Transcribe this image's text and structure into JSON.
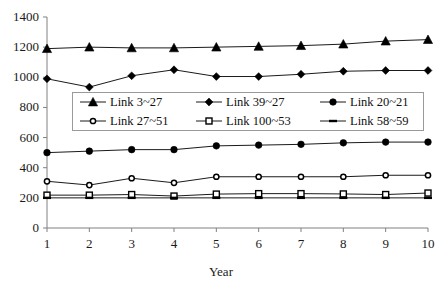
{
  "chart_data": {
    "type": "line",
    "title": "",
    "xlabel": "Year",
    "ylabel": "",
    "x": [
      1,
      2,
      3,
      4,
      5,
      6,
      7,
      8,
      9,
      10
    ],
    "xlim": [
      1,
      10
    ],
    "ylim": [
      0,
      1400
    ],
    "y_ticks": [
      0,
      200,
      400,
      600,
      800,
      1000,
      1200,
      1400
    ],
    "x_ticks": [
      1,
      2,
      3,
      4,
      5,
      6,
      7,
      8,
      9,
      10
    ],
    "grid": false,
    "legend_position": "upper-center-inside",
    "legend_columns": 3,
    "series": [
      {
        "name": "Link 3~27",
        "marker": "filled-triangle",
        "color": "#000000",
        "values": [
          1190,
          1200,
          1195,
          1195,
          1200,
          1205,
          1210,
          1220,
          1240,
          1250
        ]
      },
      {
        "name": "Link 39~27",
        "marker": "filled-diamond",
        "color": "#000000",
        "values": [
          990,
          935,
          1010,
          1050,
          1005,
          1005,
          1020,
          1040,
          1045,
          1045
        ]
      },
      {
        "name": "Link 20~21",
        "marker": "filled-circle",
        "color": "#000000",
        "values": [
          500,
          510,
          520,
          520,
          545,
          550,
          555,
          565,
          570,
          570
        ]
      },
      {
        "name": "Link 27~51",
        "marker": "open-circle",
        "color": "#000000",
        "values": [
          310,
          285,
          330,
          300,
          340,
          340,
          340,
          340,
          350,
          350
        ]
      },
      {
        "name": "Link 100~53",
        "marker": "open-square",
        "color": "#000000",
        "values": [
          218,
          218,
          222,
          212,
          225,
          228,
          228,
          226,
          222,
          232
        ]
      },
      {
        "name": "Link 58~59",
        "marker": "dash",
        "color": "#000000",
        "values": [
          200,
          200,
          200,
          200,
          200,
          200,
          200,
          200,
          200,
          200
        ]
      }
    ]
  },
  "axis": {
    "y_tick_labels": [
      "1400",
      "1200",
      "1000",
      "800",
      "600",
      "400",
      "200",
      "0"
    ],
    "x_tick_labels": [
      "1",
      "2",
      "3",
      "4",
      "5",
      "6",
      "7",
      "8",
      "9",
      "10"
    ],
    "x_title": "Year"
  },
  "legend": {
    "entries": [
      {
        "label": "Link 3~27",
        "marker": "filled-triangle"
      },
      {
        "label": "Link 39~27",
        "marker": "filled-diamond"
      },
      {
        "label": "Link 20~21",
        "marker": "filled-circle"
      },
      {
        "label": "Link 27~51",
        "marker": "open-circle"
      },
      {
        "label": "Link 100~53",
        "marker": "open-square"
      },
      {
        "label": "Link 58~59",
        "marker": "dash"
      }
    ]
  }
}
